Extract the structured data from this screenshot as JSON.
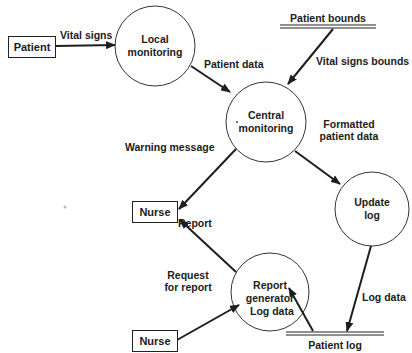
{
  "diagram": {
    "type": "data-flow-diagram",
    "external_entities": [
      {
        "id": "patient",
        "label": "Patient"
      },
      {
        "id": "nurse_top",
        "label": "Nurse"
      },
      {
        "id": "nurse_bottom",
        "label": "Nurse"
      }
    ],
    "processes": [
      {
        "id": "local_monitoring",
        "line1": "Local",
        "line2": "monitoring"
      },
      {
        "id": "central_monitoring",
        "line1": "Central",
        "line2": "monitoring"
      },
      {
        "id": "update_log",
        "line1": "Update",
        "line2": "log"
      },
      {
        "id": "report_generator",
        "line1": "Report",
        "line2": "generator"
      }
    ],
    "data_stores": [
      {
        "id": "patient_bounds",
        "label": "Patient bounds"
      },
      {
        "id": "patient_log",
        "label": "Patient log"
      }
    ],
    "flows": [
      {
        "from": "patient",
        "to": "local_monitoring",
        "label": "Vital signs"
      },
      {
        "from": "local_monitoring",
        "to": "central_monitoring",
        "label": "Patient data"
      },
      {
        "from": "patient_bounds",
        "to": "central_monitoring",
        "label": "Vital signs bounds"
      },
      {
        "from": "central_monitoring",
        "to": "update_log",
        "line1": "Formatted",
        "line2": "patient data"
      },
      {
        "from": "central_monitoring",
        "to": "nurse_top",
        "label": "Warning message"
      },
      {
        "from": "report_generator",
        "to": "nurse_top",
        "label": "Report"
      },
      {
        "from": "nurse_bottom",
        "to": "report_generator",
        "line1": "Request",
        "line2": "for report"
      },
      {
        "from": "patient_log",
        "to": "report_generator",
        "label": "Log data"
      },
      {
        "from": "update_log",
        "to": "patient_log",
        "label": "Log data"
      }
    ]
  },
  "colors": {
    "line": "#1e1e1e",
    "background": "#ffffff",
    "text": "#1c1c1c"
  }
}
